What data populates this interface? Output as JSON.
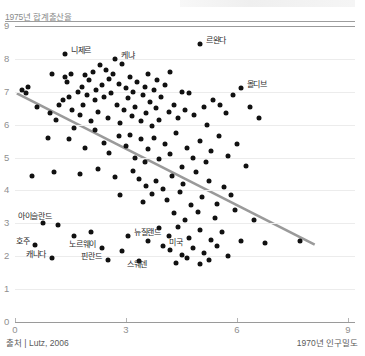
{
  "chart_data": {
    "type": "scatter",
    "title": "",
    "ylabel": "1975년 합계출산율",
    "xlabel": "1970년 인구밀도",
    "source": "출처 | Lutz, 2006",
    "xlim": [
      0,
      9
    ],
    "ylim": [
      0,
      9
    ],
    "xticks": [
      0,
      3,
      6,
      9
    ],
    "yticks": [
      0,
      1,
      2,
      3,
      4,
      5,
      6,
      7,
      8,
      9
    ],
    "grid": true,
    "legend": "none",
    "accent_color": "#111111",
    "trend_color": "#9a9a9a",
    "trendline": {
      "x0": 0.05,
      "y0": 6.95,
      "x1": 8.1,
      "y1": 2.35
    },
    "labeled_points": [
      {
        "label": "니제르",
        "x": 1.35,
        "y": 8.15
      },
      {
        "label": "케냐",
        "x": 2.7,
        "y": 8.0
      },
      {
        "label": "르완다",
        "x": 5.0,
        "y": 8.45
      },
      {
        "label": "몰디브",
        "x": 6.1,
        "y": 7.1
      },
      {
        "label": "아이슬란드",
        "x": 1.15,
        "y": 2.95
      },
      {
        "label": "뉴질랜드",
        "x": 3.05,
        "y": 2.6
      },
      {
        "label": "호주",
        "x": 0.55,
        "y": 2.35
      },
      {
        "label": "노르웨이",
        "x": 2.35,
        "y": 2.25
      },
      {
        "label": "미국",
        "x": 4.0,
        "y": 2.3
      },
      {
        "label": "캐나다",
        "x": 1.0,
        "y": 1.95
      },
      {
        "label": "핀란드",
        "x": 2.5,
        "y": 1.9
      },
      {
        "label": "스웨덴",
        "x": 3.35,
        "y": 1.85
      }
    ],
    "points": [
      {
        "x": 1.35,
        "y": 8.15
      },
      {
        "x": 2.7,
        "y": 8.0
      },
      {
        "x": 5.0,
        "y": 8.45
      },
      {
        "x": 6.1,
        "y": 7.1
      },
      {
        "x": 1.15,
        "y": 2.95
      },
      {
        "x": 3.05,
        "y": 2.6
      },
      {
        "x": 0.55,
        "y": 2.35
      },
      {
        "x": 2.35,
        "y": 2.25
      },
      {
        "x": 4.0,
        "y": 2.3
      },
      {
        "x": 1.0,
        "y": 1.95
      },
      {
        "x": 2.5,
        "y": 1.9
      },
      {
        "x": 3.35,
        "y": 1.85
      },
      {
        "x": 0.18,
        "y": 7.05
      },
      {
        "x": 0.3,
        "y": 6.95
      },
      {
        "x": 0.35,
        "y": 7.15
      },
      {
        "x": 0.6,
        "y": 6.55
      },
      {
        "x": 0.95,
        "y": 6.35
      },
      {
        "x": 1.0,
        "y": 7.55
      },
      {
        "x": 1.1,
        "y": 6.15
      },
      {
        "x": 1.2,
        "y": 6.6
      },
      {
        "x": 1.3,
        "y": 6.75
      },
      {
        "x": 1.35,
        "y": 7.45
      },
      {
        "x": 1.4,
        "y": 7.3
      },
      {
        "x": 1.45,
        "y": 6.85
      },
      {
        "x": 1.5,
        "y": 7.55
      },
      {
        "x": 1.55,
        "y": 6.45
      },
      {
        "x": 1.6,
        "y": 5.9
      },
      {
        "x": 1.7,
        "y": 7.0
      },
      {
        "x": 1.75,
        "y": 6.3
      },
      {
        "x": 1.8,
        "y": 7.15
      },
      {
        "x": 1.85,
        "y": 6.6
      },
      {
        "x": 1.9,
        "y": 7.5
      },
      {
        "x": 1.95,
        "y": 6.9
      },
      {
        "x": 2.0,
        "y": 7.35
      },
      {
        "x": 2.05,
        "y": 6.1
      },
      {
        "x": 2.1,
        "y": 7.6
      },
      {
        "x": 2.15,
        "y": 6.75
      },
      {
        "x": 2.2,
        "y": 7.05
      },
      {
        "x": 2.25,
        "y": 6.4
      },
      {
        "x": 2.3,
        "y": 7.8
      },
      {
        "x": 2.35,
        "y": 7.2
      },
      {
        "x": 2.4,
        "y": 6.85
      },
      {
        "x": 2.45,
        "y": 7.65
      },
      {
        "x": 2.5,
        "y": 6.2
      },
      {
        "x": 2.55,
        "y": 7.4
      },
      {
        "x": 2.6,
        "y": 6.95
      },
      {
        "x": 2.65,
        "y": 7.55
      },
      {
        "x": 2.75,
        "y": 6.6
      },
      {
        "x": 2.8,
        "y": 7.25
      },
      {
        "x": 2.85,
        "y": 6.05
      },
      {
        "x": 2.9,
        "y": 7.85
      },
      {
        "x": 2.95,
        "y": 6.45
      },
      {
        "x": 3.0,
        "y": 7.1
      },
      {
        "x": 3.05,
        "y": 6.8
      },
      {
        "x": 3.1,
        "y": 7.45
      },
      {
        "x": 3.15,
        "y": 6.25
      },
      {
        "x": 3.2,
        "y": 7.0
      },
      {
        "x": 3.25,
        "y": 6.55
      },
      {
        "x": 3.3,
        "y": 7.3
      },
      {
        "x": 3.4,
        "y": 6.1
      },
      {
        "x": 3.45,
        "y": 6.9
      },
      {
        "x": 3.5,
        "y": 7.15
      },
      {
        "x": 3.55,
        "y": 6.35
      },
      {
        "x": 3.6,
        "y": 7.55
      },
      {
        "x": 3.65,
        "y": 6.7
      },
      {
        "x": 3.7,
        "y": 5.95
      },
      {
        "x": 3.75,
        "y": 7.05
      },
      {
        "x": 3.8,
        "y": 6.5
      },
      {
        "x": 3.85,
        "y": 7.35
      },
      {
        "x": 3.9,
        "y": 6.15
      },
      {
        "x": 3.95,
        "y": 6.85
      },
      {
        "x": 4.05,
        "y": 7.2
      },
      {
        "x": 4.15,
        "y": 6.4
      },
      {
        "x": 4.2,
        "y": 7.6
      },
      {
        "x": 4.3,
        "y": 6.6
      },
      {
        "x": 4.4,
        "y": 6.2
      },
      {
        "x": 4.5,
        "y": 7.0
      },
      {
        "x": 4.6,
        "y": 6.45
      },
      {
        "x": 4.7,
        "y": 6.95
      },
      {
        "x": 4.85,
        "y": 6.3
      },
      {
        "x": 5.1,
        "y": 6.55
      },
      {
        "x": 5.2,
        "y": 6.0
      },
      {
        "x": 5.35,
        "y": 6.75
      },
      {
        "x": 5.55,
        "y": 6.6
      },
      {
        "x": 5.7,
        "y": 6.35
      },
      {
        "x": 5.9,
        "y": 6.9
      },
      {
        "x": 6.35,
        "y": 6.55
      },
      {
        "x": 6.6,
        "y": 6.2
      },
      {
        "x": 0.9,
        "y": 5.6
      },
      {
        "x": 1.45,
        "y": 5.55
      },
      {
        "x": 1.9,
        "y": 5.3
      },
      {
        "x": 2.15,
        "y": 5.85
      },
      {
        "x": 2.4,
        "y": 5.45
      },
      {
        "x": 2.55,
        "y": 5.15
      },
      {
        "x": 2.8,
        "y": 5.65
      },
      {
        "x": 3.0,
        "y": 5.35
      },
      {
        "x": 3.1,
        "y": 5.7
      },
      {
        "x": 3.25,
        "y": 5.0
      },
      {
        "x": 3.4,
        "y": 5.55
      },
      {
        "x": 3.5,
        "y": 4.85
      },
      {
        "x": 3.6,
        "y": 5.25
      },
      {
        "x": 3.75,
        "y": 5.6
      },
      {
        "x": 3.9,
        "y": 4.95
      },
      {
        "x": 4.05,
        "y": 5.4
      },
      {
        "x": 4.2,
        "y": 5.1
      },
      {
        "x": 4.35,
        "y": 5.75
      },
      {
        "x": 4.5,
        "y": 4.7
      },
      {
        "x": 4.65,
        "y": 5.3
      },
      {
        "x": 4.8,
        "y": 5.0
      },
      {
        "x": 5.0,
        "y": 5.5
      },
      {
        "x": 5.15,
        "y": 4.85
      },
      {
        "x": 5.3,
        "y": 5.2
      },
      {
        "x": 5.5,
        "y": 5.65
      },
      {
        "x": 5.75,
        "y": 5.05
      },
      {
        "x": 6.0,
        "y": 5.4
      },
      {
        "x": 6.25,
        "y": 4.75
      },
      {
        "x": 0.45,
        "y": 4.45
      },
      {
        "x": 1.05,
        "y": 4.55
      },
      {
        "x": 1.75,
        "y": 4.5
      },
      {
        "x": 2.25,
        "y": 4.65
      },
      {
        "x": 2.7,
        "y": 4.4
      },
      {
        "x": 3.2,
        "y": 4.6
      },
      {
        "x": 3.35,
        "y": 4.35
      },
      {
        "x": 3.55,
        "y": 4.15
      },
      {
        "x": 3.8,
        "y": 4.3
      },
      {
        "x": 4.0,
        "y": 4.05
      },
      {
        "x": 4.25,
        "y": 4.45
      },
      {
        "x": 4.55,
        "y": 4.2
      },
      {
        "x": 4.9,
        "y": 4.55
      },
      {
        "x": 5.25,
        "y": 4.3
      },
      {
        "x": 5.65,
        "y": 4.1
      },
      {
        "x": 2.85,
        "y": 3.85
      },
      {
        "x": 3.45,
        "y": 3.65
      },
      {
        "x": 3.7,
        "y": 3.9
      },
      {
        "x": 4.1,
        "y": 3.7
      },
      {
        "x": 4.45,
        "y": 3.95
      },
      {
        "x": 4.75,
        "y": 3.55
      },
      {
        "x": 5.05,
        "y": 3.8
      },
      {
        "x": 5.45,
        "y": 3.6
      },
      {
        "x": 5.85,
        "y": 3.85
      },
      {
        "x": 4.3,
        "y": 3.3
      },
      {
        "x": 4.6,
        "y": 3.1
      },
      {
        "x": 4.95,
        "y": 3.35
      },
      {
        "x": 5.4,
        "y": 3.15
      },
      {
        "x": 5.95,
        "y": 3.4
      },
      {
        "x": 6.45,
        "y": 3.1
      },
      {
        "x": 3.9,
        "y": 2.85
      },
      {
        "x": 4.15,
        "y": 2.6
      },
      {
        "x": 4.4,
        "y": 2.9
      },
      {
        "x": 4.7,
        "y": 2.55
      },
      {
        "x": 5.0,
        "y": 2.8
      },
      {
        "x": 5.3,
        "y": 2.5
      },
      {
        "x": 5.6,
        "y": 2.75
      },
      {
        "x": 6.1,
        "y": 2.45
      },
      {
        "x": 6.75,
        "y": 2.4
      },
      {
        "x": 7.7,
        "y": 2.45
      },
      {
        "x": 4.2,
        "y": 2.2
      },
      {
        "x": 4.5,
        "y": 2.05
      },
      {
        "x": 4.8,
        "y": 2.25
      },
      {
        "x": 5.1,
        "y": 2.1
      },
      {
        "x": 5.45,
        "y": 2.3
      },
      {
        "x": 5.75,
        "y": 2.0
      },
      {
        "x": 4.35,
        "y": 1.8
      },
      {
        "x": 4.65,
        "y": 1.95
      },
      {
        "x": 5.0,
        "y": 1.75
      },
      {
        "x": 5.25,
        "y": 1.9
      },
      {
        "x": 1.6,
        "y": 2.6
      },
      {
        "x": 2.05,
        "y": 2.75
      },
      {
        "x": 2.9,
        "y": 2.15
      },
      {
        "x": 3.6,
        "y": 2.45
      },
      {
        "x": 0.75,
        "y": 3.0
      }
    ]
  }
}
